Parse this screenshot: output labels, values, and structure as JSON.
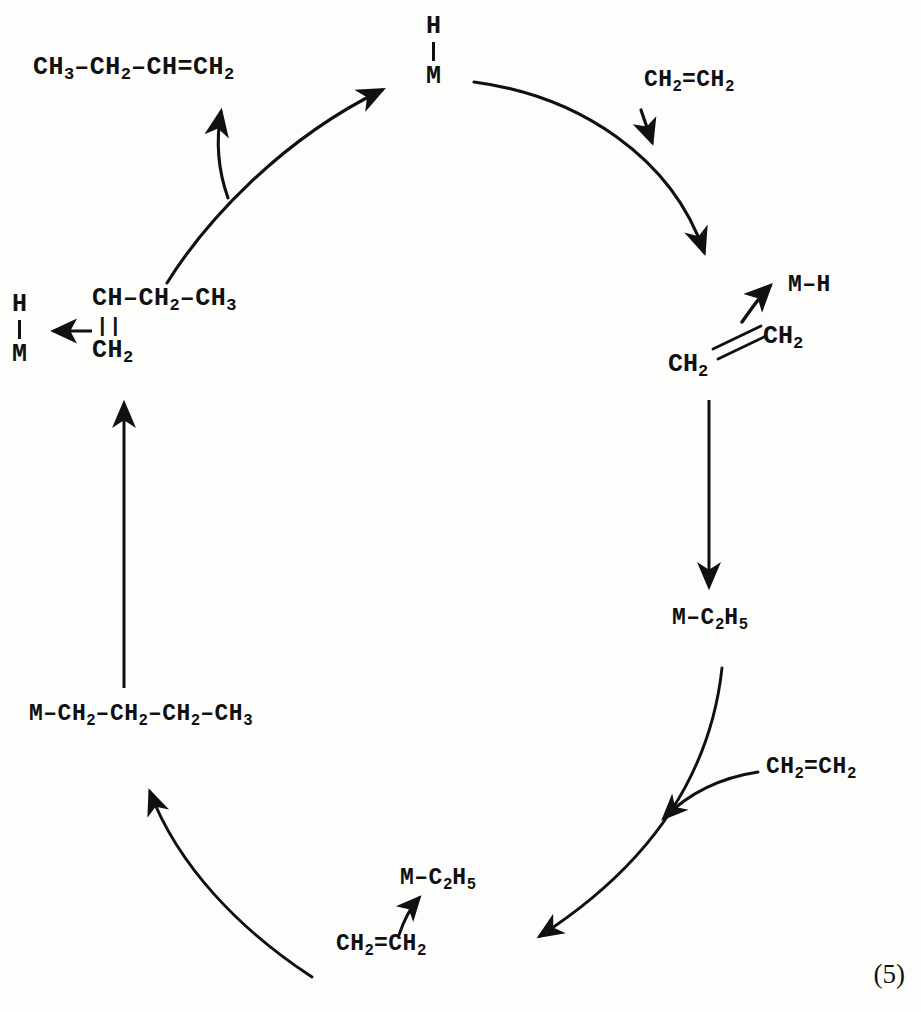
{
  "scheme": {
    "equation_number": "(5)",
    "ink_color": "#101010",
    "background_color": "#fdfdfc",
    "title": "Catalytic olefin insertion / beta-hydride elimination cycle"
  },
  "species": {
    "metal_hydride_top": {
      "upper": "H",
      "lower": "M"
    },
    "metal_hydride_left": {
      "upper": "H",
      "lower": "M"
    },
    "butene": "CH3-CH2-CH=CH2",
    "butene_parts": {
      "a": "CH",
      "a_sub": "3",
      "b": "CH",
      "b_sub": "2",
      "c": "CH",
      "d": "CH",
      "d_sub": "2"
    },
    "ethylene_top_right": "CH2=CH2",
    "ethylene_bottom_right": "CH2=CH2",
    "ethylene_bottom_center": "CH2=CH2",
    "metal_hydride_released": "M-H",
    "pi_complex": {
      "lower_left": "CH2",
      "upper_right": "CH2"
    },
    "metal_ethyl_right": "M-C2H5",
    "metal_ethyl_bottom": "M-C2H5",
    "metal_butyl": "M-CH2-CH2-CH2-CH3",
    "beta_fragment": {
      "top_row": "CH-CH2-CH3",
      "double_bond": "||",
      "bottom_row": "CH2"
    }
  },
  "labels": {
    "butene_segments": [
      "CH",
      "3",
      "–CH",
      "2",
      "–CH=CH",
      "2"
    ],
    "metal_butyl_segments": [
      "M–CH",
      "2",
      "–CH",
      "2",
      "–CH",
      "2",
      "–CH",
      "3"
    ],
    "ethylene_segments": [
      "CH",
      "2",
      "=CH",
      "2"
    ],
    "metal_ethyl_segments": [
      "M–C",
      "2",
      "H",
      "5"
    ],
    "beta_top_segments": [
      "CH–CH",
      "2",
      "–CH",
      "3"
    ],
    "beta_bottom_segments": [
      "CH",
      "2"
    ],
    "metal_hydride_released_text": "M–H",
    "ch2_text": "CH",
    "ch2_sub": "2"
  },
  "arrows": [
    {
      "name": "arc-butyl-to-hydride",
      "kind": "cycle-arc",
      "note": "upper-left arc rising to H-M"
    },
    {
      "name": "arc-hydride-to-complex",
      "kind": "cycle-arc",
      "note": "upper-right arc descending to pi-complex"
    },
    {
      "name": "arc-ethyl-to-butyl",
      "kind": "cycle-arc",
      "note": "lower-right arc"
    },
    {
      "name": "arc-bottom-to-butyl",
      "kind": "cycle-arc",
      "note": "lower-left arc rising to M-butyl"
    },
    {
      "name": "arrow-butene-release",
      "kind": "branch",
      "note": "branch arrow to 1-butene"
    },
    {
      "name": "arrow-ethylene-feed-top",
      "kind": "feed",
      "note": "ethylene entering top right"
    },
    {
      "name": "arrow-ethylene-feed-bottom",
      "kind": "feed",
      "note": "ethylene entering lower right"
    },
    {
      "name": "arrow-mh-release",
      "kind": "branch",
      "note": "M-H released from complex"
    },
    {
      "name": "arrow-complex-to-ethyl",
      "kind": "straight",
      "note": "vertical insertion arrow, right"
    },
    {
      "name": "arrow-butyl-to-fragment",
      "kind": "straight",
      "note": "vertical arrow, left"
    },
    {
      "name": "arrow-fragment-to-hydride",
      "kind": "straight",
      "note": "horizontal arrow to H-M, left"
    },
    {
      "name": "arrow-ethylene-to-methyl",
      "kind": "branch",
      "note": "bottom small arrow to M-C2H5"
    }
  ]
}
